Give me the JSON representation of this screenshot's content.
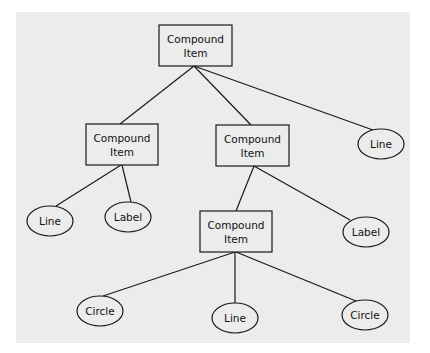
{
  "diagram": {
    "type": "tree",
    "background": "#ececec",
    "nodes": [
      {
        "id": "root",
        "shape": "rect",
        "lines": [
          "Compound",
          "Item"
        ],
        "x": 159,
        "y": 25,
        "w": 73,
        "h": 41
      },
      {
        "id": "c1",
        "shape": "rect",
        "lines": [
          "Compound",
          "Item"
        ],
        "x": 86,
        "y": 124,
        "w": 72,
        "h": 41
      },
      {
        "id": "c2",
        "shape": "rect",
        "lines": [
          "Compound",
          "Item"
        ],
        "x": 216,
        "y": 125,
        "w": 73,
        "h": 41
      },
      {
        "id": "line1",
        "shape": "ellipse",
        "lines": [
          "Line"
        ],
        "cx": 381,
        "cy": 144,
        "rx": 23,
        "ry": 15
      },
      {
        "id": "line2",
        "shape": "ellipse",
        "lines": [
          "Line"
        ],
        "cx": 50,
        "cy": 221,
        "rx": 23,
        "ry": 15
      },
      {
        "id": "label1",
        "shape": "ellipse",
        "lines": [
          "Label"
        ],
        "cx": 128,
        "cy": 217,
        "rx": 23,
        "ry": 15
      },
      {
        "id": "c3",
        "shape": "rect",
        "lines": [
          "Compound",
          "Item"
        ],
        "x": 200,
        "y": 211,
        "w": 72,
        "h": 41
      },
      {
        "id": "label2",
        "shape": "ellipse",
        "lines": [
          "Label"
        ],
        "cx": 366,
        "cy": 232,
        "rx": 23,
        "ry": 15
      },
      {
        "id": "circle1",
        "shape": "ellipse",
        "lines": [
          "Circle"
        ],
        "cx": 100,
        "cy": 311,
        "rx": 23,
        "ry": 15
      },
      {
        "id": "line3",
        "shape": "ellipse",
        "lines": [
          "Line"
        ],
        "cx": 235,
        "cy": 318,
        "rx": 23,
        "ry": 15
      },
      {
        "id": "circle2",
        "shape": "ellipse",
        "lines": [
          "Circle"
        ],
        "cx": 365,
        "cy": 315,
        "rx": 23,
        "ry": 15
      }
    ],
    "edges": [
      {
        "from": "root",
        "to": "c1",
        "x1": 194,
        "y1": 66,
        "x2": 120,
        "y2": 124
      },
      {
        "from": "root",
        "to": "c2",
        "x1": 194,
        "y1": 66,
        "x2": 251,
        "y2": 125
      },
      {
        "from": "root",
        "to": "line1",
        "x1": 194,
        "y1": 66,
        "x2": 373,
        "y2": 130
      },
      {
        "from": "c1",
        "to": "line2",
        "x1": 121,
        "y1": 165,
        "x2": 56,
        "y2": 206
      },
      {
        "from": "c1",
        "to": "label1",
        "x1": 122,
        "y1": 165,
        "x2": 131,
        "y2": 202
      },
      {
        "from": "c2",
        "to": "c3",
        "x1": 254,
        "y1": 166,
        "x2": 236,
        "y2": 211
      },
      {
        "from": "c2",
        "to": "label2",
        "x1": 254,
        "y1": 166,
        "x2": 350,
        "y2": 220
      },
      {
        "from": "c3",
        "to": "circle1",
        "x1": 235,
        "y1": 252,
        "x2": 103,
        "y2": 296
      },
      {
        "from": "c3",
        "to": "line3",
        "x1": 235,
        "y1": 252,
        "x2": 235,
        "y2": 303
      },
      {
        "from": "c3",
        "to": "circle2",
        "x1": 236,
        "y1": 252,
        "x2": 356,
        "y2": 301
      }
    ]
  }
}
